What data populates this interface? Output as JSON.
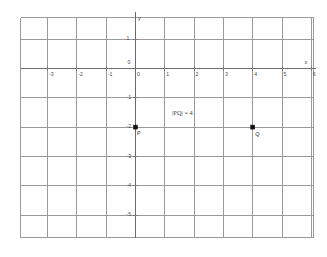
{
  "figure": {
    "title": "",
    "background_color": "#ffffff",
    "grid_color": "#9a9a9a",
    "axis_color": "#6b6b6b",
    "point_color": "#111111"
  },
  "axes": {
    "x_label": "x",
    "y_label": "y",
    "origin_label": "0",
    "x_ticks": [
      {
        "value": -4,
        "label": "-4"
      },
      {
        "value": -3,
        "label": "-3"
      },
      {
        "value": -2,
        "label": "-2"
      },
      {
        "value": -1,
        "label": "-1"
      },
      {
        "value": 0,
        "label": "0"
      },
      {
        "value": 1,
        "label": "1"
      },
      {
        "value": 2,
        "label": "2"
      },
      {
        "value": 3,
        "label": "3"
      },
      {
        "value": 4,
        "label": "4"
      },
      {
        "value": 5,
        "label": "5"
      },
      {
        "value": 6,
        "label": "6"
      }
    ],
    "y_ticks": [
      {
        "value": 2,
        "label": "2"
      },
      {
        "value": 1,
        "label": "1"
      },
      {
        "value": 0,
        "label": "0"
      },
      {
        "value": -1,
        "label": "-1"
      },
      {
        "value": -2,
        "label": "-2"
      },
      {
        "value": -3,
        "label": "-3"
      },
      {
        "value": -4,
        "label": "-4"
      },
      {
        "value": -5,
        "label": "-5"
      },
      {
        "value": -6,
        "label": "-6"
      }
    ]
  },
  "annotation": {
    "distance_text": "|PQ| = 4"
  },
  "chart_data": {
    "type": "scatter",
    "title": "",
    "xlabel": "x",
    "ylabel": "y",
    "xlim": [
      -4.7,
      6.7
    ],
    "ylim": [
      -6.4,
      2.5
    ],
    "grid": true,
    "legend": "none",
    "points": [
      {
        "name": "P",
        "label": "P",
        "x": 0,
        "y": -2
      },
      {
        "name": "Q",
        "label": "Q",
        "x": 4,
        "y": -2
      }
    ],
    "annotations": [
      {
        "text": "|PQ| = 4",
        "x": 2.0,
        "y": -1.55
      }
    ]
  }
}
